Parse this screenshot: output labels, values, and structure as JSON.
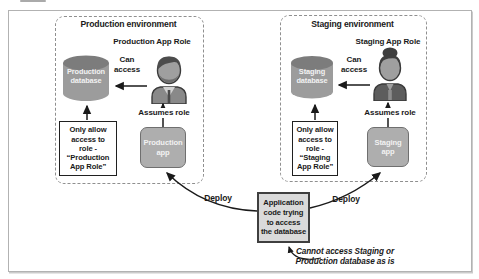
{
  "production": {
    "title": "Production environment",
    "role_label": "Production App Role",
    "database_label": "Production\ndatabase",
    "can_access_label": "Can\naccess",
    "assumes_role_label": "Assumes role",
    "app_label": "Production\napp",
    "policy_text": "Only allow\naccess to\nrole -\n“Production\nApp Role”"
  },
  "staging": {
    "title": "Staging environment",
    "role_label": "Staging App Role",
    "database_label": "Staging\ndatabase",
    "can_access_label": "Can\naccess",
    "assumes_role_label": "Assumes role",
    "app_label": "Staging\napp",
    "policy_text": "Only allow\naccess to\nrole -\n“Staging\nApp Role”"
  },
  "center": {
    "app_code_label": "Application\ncode trying\nto access\nthe database",
    "deploy_left_label": "Deploy",
    "deploy_right_label": "Deploy",
    "note_text": "Cannot access Staging or\nProduction database as is"
  },
  "colors": {
    "frame_border": "#b2b2b2",
    "dashed_border": "#8f8f8f",
    "cylinder_body": "#9c9c9c",
    "cylinder_top": "#7c7c7c",
    "app_box_fill": "#aeaeae",
    "app_box_border": "#6f6f6f",
    "center_box_fill": "#dadada",
    "center_box_border": "#3f3f3f",
    "policy_box_border": "#202020",
    "line": "#1a1a1a",
    "text": "#1a1a1a",
    "light_text": "#f2f2f2"
  }
}
